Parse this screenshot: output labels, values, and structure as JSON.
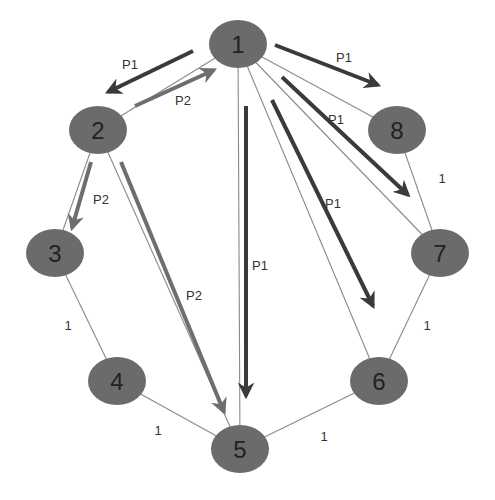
{
  "colors": {
    "node_fill": "#6b6b6b",
    "edge": "#8a8a8a",
    "arrow_p1": "#3a3a3a",
    "arrow_p2": "#6e6e6e",
    "background": "#ffffff"
  },
  "nodes": [
    {
      "id": "1",
      "label": "1",
      "x": 238,
      "y": 44
    },
    {
      "id": "2",
      "label": "2",
      "x": 98,
      "y": 130
    },
    {
      "id": "3",
      "label": "3",
      "x": 55,
      "y": 253
    },
    {
      "id": "4",
      "label": "4",
      "x": 117,
      "y": 381
    },
    {
      "id": "5",
      "label": "5",
      "x": 240,
      "y": 449
    },
    {
      "id": "6",
      "label": "6",
      "x": 379,
      "y": 381
    },
    {
      "id": "7",
      "label": "7",
      "x": 440,
      "y": 253
    },
    {
      "id": "8",
      "label": "8",
      "x": 397,
      "y": 130
    }
  ],
  "edges": [
    {
      "from": "1",
      "to": "2"
    },
    {
      "from": "2",
      "to": "3"
    },
    {
      "from": "3",
      "to": "4",
      "weight": "1"
    },
    {
      "from": "4",
      "to": "5",
      "weight": "1"
    },
    {
      "from": "5",
      "to": "6",
      "weight": "1"
    },
    {
      "from": "6",
      "to": "7",
      "weight": "1"
    },
    {
      "from": "7",
      "to": "8",
      "weight": "1"
    },
    {
      "from": "8",
      "to": "1"
    },
    {
      "from": "1",
      "to": "5"
    },
    {
      "from": "1",
      "to": "6"
    },
    {
      "from": "1",
      "to": "7"
    },
    {
      "from": "2",
      "to": "5"
    }
  ],
  "edge_labels": [
    {
      "text": "1",
      "x": 68,
      "y": 330
    },
    {
      "text": "1",
      "x": 158,
      "y": 435
    },
    {
      "text": "1",
      "x": 324,
      "y": 441
    },
    {
      "text": "1",
      "x": 427,
      "y": 330
    },
    {
      "text": "1",
      "x": 442,
      "y": 183
    }
  ],
  "paths": [
    {
      "name": "P1",
      "arrows": [
        {
          "x1": 193,
          "y1": 51,
          "x2": 108,
          "y2": 92,
          "label_x": 130,
          "label_y": 69
        },
        {
          "x1": 275,
          "y1": 45,
          "x2": 378,
          "y2": 85,
          "label_x": 344,
          "label_y": 62
        },
        {
          "x1": 282,
          "y1": 77,
          "x2": 408,
          "y2": 195,
          "label_x": 336,
          "label_y": 124
        },
        {
          "x1": 272,
          "y1": 100,
          "x2": 373,
          "y2": 306,
          "label_x": 333,
          "label_y": 208
        },
        {
          "x1": 246,
          "y1": 106,
          "x2": 246,
          "y2": 396,
          "label_x": 260,
          "label_y": 270
        }
      ]
    },
    {
      "name": "P2",
      "arrows": [
        {
          "x1": 135,
          "y1": 106,
          "x2": 214,
          "y2": 70,
          "label_x": 183,
          "label_y": 105
        },
        {
          "x1": 91,
          "y1": 162,
          "x2": 72,
          "y2": 228,
          "label_x": 101,
          "label_y": 204
        },
        {
          "x1": 121,
          "y1": 162,
          "x2": 224,
          "y2": 412,
          "label_x": 194,
          "label_y": 300
        }
      ]
    }
  ]
}
